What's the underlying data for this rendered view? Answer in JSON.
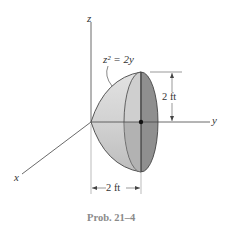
{
  "diagram": {
    "axes": {
      "z_label": "z",
      "y_label": "y",
      "x_label": "x"
    },
    "equation": "z² = 2y",
    "dim_height": "2 ft",
    "dim_width": "2 ft",
    "caption": "Prob. 21–4",
    "colors": {
      "shell_light": "#dcdcdc",
      "shell_mid": "#c4c4c4",
      "base_face": "#8f8f8f",
      "line": "#333333"
    }
  }
}
